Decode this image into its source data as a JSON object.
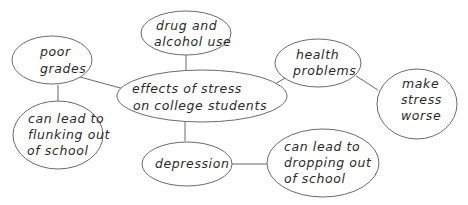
{
  "diagram": {
    "type": "concept-web",
    "central": {
      "id": "center",
      "lines": [
        "effects of stress",
        "on college students"
      ]
    },
    "nodes": [
      {
        "id": "drug",
        "lines": [
          "drug and",
          "alcohol use"
        ]
      },
      {
        "id": "grades",
        "lines": [
          "poor",
          "grades"
        ]
      },
      {
        "id": "health",
        "lines": [
          "health",
          "problems"
        ]
      },
      {
        "id": "worse",
        "lines": [
          "make",
          "stress",
          "worse"
        ]
      },
      {
        "id": "flunk",
        "lines": [
          "can lead to",
          "flunking out",
          "of school"
        ]
      },
      {
        "id": "depression",
        "lines": [
          "depression"
        ]
      },
      {
        "id": "dropout",
        "lines": [
          "can lead to",
          "dropping out",
          "of school"
        ]
      }
    ],
    "edges": [
      [
        "center",
        "drug"
      ],
      [
        "center",
        "grades"
      ],
      [
        "center",
        "health"
      ],
      [
        "center",
        "depression"
      ],
      [
        "grades",
        "flunk"
      ],
      [
        "health",
        "worse"
      ],
      [
        "depression",
        "dropout"
      ]
    ],
    "colors": {
      "stroke": "#6b6b6b",
      "text": "#2a2a2a",
      "background": "#ffffff"
    }
  }
}
